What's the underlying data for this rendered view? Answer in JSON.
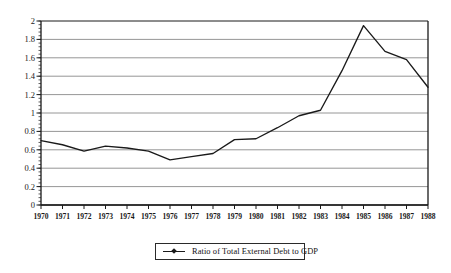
{
  "chart_data": {
    "type": "line",
    "title": "",
    "xlabel": "",
    "ylabel": "",
    "ylim": [
      0,
      2
    ],
    "ytick_step": 0.2,
    "grid": true,
    "legend_position": "bottom-center",
    "line_color": "#1a1a1a",
    "grid_color": "#8a8a8a",
    "axis_color": "#1a1a1a",
    "background": "#ffffff",
    "categories": [
      "1970",
      "1971",
      "1972",
      "1973",
      "1974",
      "1975",
      "1976",
      "1977",
      "1978",
      "1979",
      "1980",
      "1981",
      "1982",
      "1983",
      "1984",
      "1985",
      "1986",
      "1987",
      "1988"
    ],
    "ytick_labels": [
      "0",
      "0.2",
      "0.4",
      "0.6",
      "0.8",
      "1",
      "1.2",
      "1.4",
      "1.6",
      "1.8",
      "2"
    ],
    "ytick_values": [
      0,
      0.2,
      0.4,
      0.6,
      0.8,
      1,
      1.2,
      1.4,
      1.6,
      1.8,
      2
    ],
    "series": [
      {
        "name": "Ratio of Total External Debt to GDP",
        "values": [
          0.7,
          0.655,
          0.585,
          0.64,
          0.62,
          0.585,
          0.49,
          0.525,
          0.56,
          0.71,
          0.72,
          0.84,
          0.97,
          1.03,
          1.46,
          1.95,
          1.67,
          1.58,
          1.28
        ]
      }
    ]
  },
  "legend": {
    "marker_name": "line-marker",
    "label": "Ratio of Total External Debt to GDP"
  }
}
